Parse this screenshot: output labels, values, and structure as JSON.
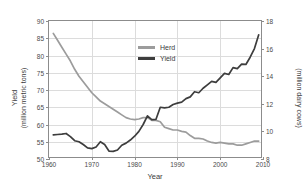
{
  "caption": {
    "partial_text": "· · ·"
  },
  "chart_data": {
    "type": "line",
    "title": "",
    "xlabel": "Year",
    "ylabel": "Yield (million metric tons)",
    "ylabel_main": "Yield",
    "ylabel_sub": "(million metric tons)",
    "y2label": "Herd (million dairy cows)",
    "y2label_main": "Herd",
    "y2label_sub": "(million dairy cows)",
    "xlim": [
      1960,
      2010
    ],
    "ylim": [
      50,
      90
    ],
    "y2lim": [
      8,
      18
    ],
    "xticks": [
      1960,
      1970,
      1980,
      1990,
      2000,
      2010
    ],
    "xtick_labels": [
      "1960",
      "1970",
      "1980",
      "1990",
      "2000",
      "2010"
    ],
    "yticks": [
      50,
      55,
      60,
      65,
      70,
      75,
      80,
      85,
      90
    ],
    "ytick_labels": [
      "50",
      "55",
      "60",
      "65",
      "70",
      "75",
      "80",
      "85",
      "90"
    ],
    "y2ticks": [
      8,
      10,
      12,
      14,
      16,
      18
    ],
    "y2tick_labels": [
      "8",
      "10",
      "12",
      "14",
      "16",
      "18"
    ],
    "grid": true,
    "legend_position": "top-center",
    "colors": {
      "herd": "#9c9c9c",
      "yield": "#3d3d3d",
      "grid": "#dcdcdc",
      "axis": "#8c8c8c",
      "text": "#3a3a3a"
    },
    "series": [
      {
        "name": "Herd",
        "axis": "right",
        "units": "million dairy cows",
        "color": "#9c9c9c",
        "x": [
          1961,
          1962,
          1963,
          1964,
          1965,
          1966,
          1967,
          1968,
          1969,
          1970,
          1971,
          1972,
          1973,
          1974,
          1975,
          1976,
          1977,
          1978,
          1979,
          1980,
          1981,
          1982,
          1983,
          1984,
          1985,
          1986,
          1987,
          1988,
          1989,
          1990,
          1991,
          1992,
          1993,
          1994,
          1995,
          1996,
          1997,
          1998,
          1999,
          2000,
          2001,
          2002,
          2003,
          2004,
          2005,
          2006,
          2007,
          2008,
          2009
        ],
        "values": [
          17.1,
          16.6,
          16.1,
          15.6,
          15.1,
          14.5,
          14.0,
          13.6,
          13.2,
          12.8,
          12.5,
          12.2,
          12.0,
          11.8,
          11.6,
          11.4,
          11.2,
          11.0,
          10.9,
          10.85,
          10.9,
          11.0,
          11.0,
          10.8,
          10.8,
          10.7,
          10.3,
          10.2,
          10.1,
          10.1,
          10.0,
          9.95,
          9.7,
          9.5,
          9.5,
          9.45,
          9.3,
          9.2,
          9.15,
          9.2,
          9.15,
          9.1,
          9.1,
          9.0,
          9.0,
          9.1,
          9.2,
          9.3,
          9.3
        ]
      },
      {
        "name": "Yield",
        "axis": "left",
        "units": "million metric tons",
        "color": "#3d3d3d",
        "x": [
          1961,
          1962,
          1963,
          1964,
          1965,
          1966,
          1967,
          1968,
          1969,
          1970,
          1971,
          1972,
          1973,
          1974,
          1975,
          1976,
          1977,
          1978,
          1979,
          1980,
          1981,
          1982,
          1983,
          1984,
          1985,
          1986,
          1987,
          1988,
          1989,
          1990,
          1991,
          1992,
          1993,
          1994,
          1995,
          1996,
          1997,
          1998,
          1999,
          2000,
          2001,
          2002,
          2003,
          2004,
          2005,
          2006,
          2007,
          2008,
          2009
        ],
        "values": [
          57.0,
          57.1,
          57.2,
          57.4,
          56.5,
          55.3,
          55.0,
          54.2,
          53.2,
          53.0,
          53.5,
          55.0,
          54.2,
          52.3,
          52.2,
          52.6,
          54.0,
          54.6,
          55.5,
          56.6,
          58.0,
          60.0,
          62.5,
          61.4,
          61.5,
          65.0,
          64.8,
          65.0,
          65.8,
          66.2,
          66.5,
          67.5,
          68.0,
          69.5,
          69.2,
          70.5,
          71.5,
          72.5,
          72.2,
          73.5,
          74.8,
          74.5,
          76.5,
          76.2,
          77.5,
          77.4,
          79.5,
          82.0,
          86.0
        ]
      }
    ]
  },
  "legend": {
    "items": [
      {
        "label": "Herd",
        "color": "#9c9c9c"
      },
      {
        "label": "Yield",
        "color": "#3d3d3d"
      }
    ]
  }
}
